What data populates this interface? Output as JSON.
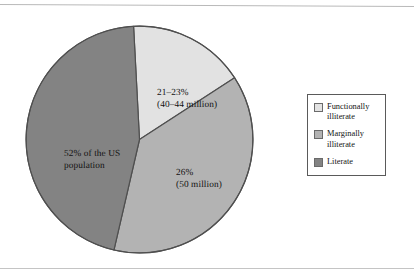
{
  "chart_data": {
    "type": "pie",
    "title": "",
    "subtitle": "",
    "xlabel": "",
    "ylabel": "",
    "legend_position": "right",
    "grid": false,
    "categories": [
      "Functionally illiterate",
      "Marginally illiterate",
      "Literate"
    ],
    "values": [
      22,
      26,
      52
    ],
    "value_labels": [
      "21–23%",
      "26%",
      "52%"
    ],
    "count_labels": [
      "(40–44 million)",
      "(50 million)",
      ""
    ],
    "slices": [
      {
        "name": "Functionally illiterate",
        "percent": 22,
        "percent_text": "21–23%",
        "count_text": "(40–44 million)",
        "label_text": "21–23%\n(40–44 million)",
        "color": "#e2e2e2",
        "start_angle_deg": -3,
        "end_angle_deg": 57
      },
      {
        "name": "Marginally illiterate",
        "percent": 26,
        "percent_text": "26%",
        "count_text": "(50 million)",
        "label_text": "26%\n(50 million)",
        "color": "#b3b3b3",
        "start_angle_deg": 57,
        "end_angle_deg": 193
      },
      {
        "name": "Literate",
        "percent": 52,
        "percent_text": "52%",
        "count_text": "",
        "label_text": "52% of the US\npopulation",
        "color": "#838383",
        "start_angle_deg": 193,
        "end_angle_deg": 357
      }
    ]
  },
  "pie": {
    "label_functionally_illiterate": "21–23%\n(40–44 million)",
    "label_marginally_illiterate": "26%\n(50 million)",
    "label_literate": "52% of the US\npopulation"
  },
  "legend": {
    "items": [
      {
        "label": "Functionally\nilliterate",
        "color": "#e2e2e2",
        "swatch_name": "legend-swatch-functionally-illiterate"
      },
      {
        "label": "Marginally\nilliterate",
        "color": "#b3b3b3",
        "swatch_name": "legend-swatch-marginally-illiterate"
      },
      {
        "label": "Literate",
        "color": "#838383",
        "swatch_name": "legend-swatch-literate"
      }
    ]
  },
  "colors": {
    "functionally_illiterate": "#e2e2e2",
    "marginally_illiterate": "#b3b3b3",
    "literate": "#838383",
    "outline": "#4f4f4f",
    "legend_border": "#5a5a5a",
    "background": "#ffffff"
  }
}
